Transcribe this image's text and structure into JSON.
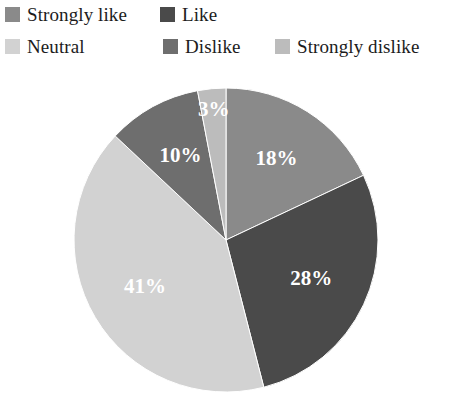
{
  "legend": {
    "items": [
      {
        "label": "Strongly like",
        "color": "#8a8a8a"
      },
      {
        "label": "Like",
        "color": "#4a4a4a"
      },
      {
        "label": "Neutral",
        "color": "#d2d2d2"
      },
      {
        "label": "Dislike",
        "color": "#6e6e6e"
      },
      {
        "label": "Strongly dislike",
        "color": "#bcbcbc"
      }
    ]
  },
  "chart_data": {
    "type": "pie",
    "title": "",
    "categories": [
      "Strongly like",
      "Like",
      "Neutral",
      "Dislike",
      "Strongly dislike"
    ],
    "values": [
      18,
      28,
      41,
      10,
      3
    ],
    "value_labels": [
      "18%",
      "28%",
      "41%",
      "10%",
      "3%"
    ],
    "colors": [
      "#8a8a8a",
      "#4a4a4a",
      "#d2d2d2",
      "#6e6e6e",
      "#bcbcbc"
    ],
    "units": "percent",
    "start_angle_deg": 0,
    "direction": "clockwise",
    "legend_position": "top",
    "label_color": "#ffffff",
    "background": "#ffffff",
    "total": 100
  }
}
